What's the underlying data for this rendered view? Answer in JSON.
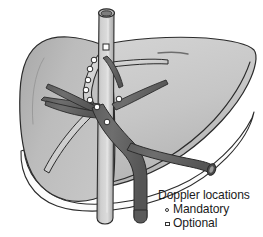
{
  "figure": {
    "background_color": "#ffffff"
  },
  "legend": {
    "title": "Doppler locations",
    "items": [
      {
        "symbol": "circle-outline",
        "symbol_name": "mandatory-marker-icon",
        "label": "Mandatory"
      },
      {
        "symbol": "square-outline",
        "symbol_name": "optional-marker-icon",
        "label": "Optional"
      }
    ]
  },
  "colors": {
    "liver_left_lobe": "#b5b5b5",
    "liver_right_lobe": "#c9c9c9",
    "liver_inferior_band": "#fbfbfb",
    "liver_outline": "#2b2b2b",
    "vena_cava_fill": "#c4c4c4",
    "vena_cava_lumen": "#8e8e8e",
    "portal_vein_fill": "#6a6a6a",
    "hepatic_vein_fill": "#d6d6d6",
    "marker_fill": "#ffffff",
    "marker_stroke": "#2b2b2b",
    "text": "#1b1b1b"
  },
  "structures": [
    {
      "name": "inferior-vena-cava",
      "type": "vessel",
      "shade": "light"
    },
    {
      "name": "hepatic-vein-confluence",
      "type": "vessel",
      "shade": "light"
    },
    {
      "name": "portal-vein-main",
      "type": "vessel",
      "shade": "dark"
    },
    {
      "name": "portal-vein-right-branch",
      "type": "vessel",
      "shade": "dark"
    },
    {
      "name": "portal-vein-left-branch",
      "type": "vessel",
      "shade": "dark"
    },
    {
      "name": "liver-left-lobe",
      "type": "organ"
    },
    {
      "name": "liver-right-lobe",
      "type": "organ"
    }
  ],
  "markers": {
    "mandatory": [
      {
        "id": "m1",
        "x": 94,
        "y": 60
      },
      {
        "id": "m2",
        "x": 90,
        "y": 69
      },
      {
        "id": "m3",
        "x": 88,
        "y": 80
      },
      {
        "id": "m4",
        "x": 86,
        "y": 90
      },
      {
        "id": "m5",
        "x": 90,
        "y": 100
      },
      {
        "id": "m6",
        "x": 97,
        "y": 107
      },
      {
        "id": "m7",
        "x": 119,
        "y": 99
      },
      {
        "id": "m8",
        "x": 107,
        "y": 122
      }
    ],
    "optional": [
      {
        "id": "o1",
        "x": 106,
        "y": 47
      }
    ]
  }
}
